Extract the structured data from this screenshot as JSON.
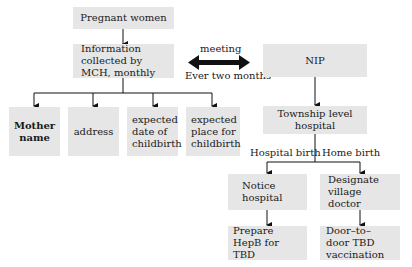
{
  "left_flow": {
    "top": "Pregnant women",
    "info": "Information collected by MCH, monthly",
    "fields": [
      "Mother name",
      "address",
      "expected date of childbirth",
      "expected place for childbirth"
    ]
  },
  "link": {
    "top_label": "meeting",
    "bottom_label": "Ever two months"
  },
  "right_flow": {
    "top": "NIP",
    "hospital": "Township level hospital",
    "branch_left_label": "Hospital birth",
    "branch_right_label": "Home birth",
    "left_step1": "Notice hospital",
    "left_step2": "Prepare HepB for TBD",
    "right_step1": "Designate village doctor",
    "right_step2": "Door–to–door TBD vaccination"
  },
  "colors": {
    "box_fill": "#e6e6e6",
    "line": "#111111"
  }
}
